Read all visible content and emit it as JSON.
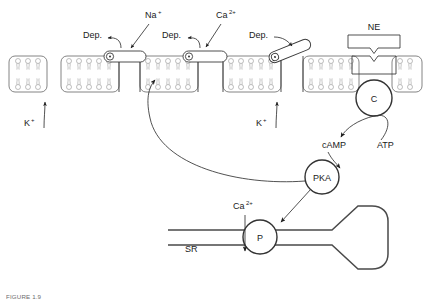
{
  "figure": {
    "caption_prefix": "FIGURE 1.9",
    "caption_text": "FIGURE 1.9"
  },
  "labels": {
    "na": "Na",
    "na_sup": "+",
    "ca": "Ca",
    "ca_sup": "2+",
    "k": "K",
    "k_sup": "+",
    "dep": "Dep.",
    "ne": "NE",
    "c": "C",
    "camp": "cAMP",
    "atp": "ATP",
    "pka": "PKA",
    "p": "P",
    "sr": "SR"
  },
  "ions": [
    {
      "name": "sodium",
      "text": "Na",
      "sup": "+",
      "x": 150,
      "y": 16
    },
    {
      "name": "calcium-extracellular",
      "text": "Ca",
      "sup": "2+",
      "x": 222,
      "y": 16
    },
    {
      "name": "potassium-left",
      "text": "K",
      "sup": "+",
      "x": 26,
      "y": 124
    },
    {
      "name": "potassium-right",
      "text": "K",
      "sup": "+",
      "x": 258,
      "y": 124
    },
    {
      "name": "calcium-sr",
      "text": "Ca",
      "sup": "2+",
      "x": 212,
      "y": 208
    }
  ],
  "depolarization_labels": [
    {
      "name": "dep-sodium-channel",
      "text": "Dep.",
      "x": 85,
      "y": 36
    },
    {
      "name": "dep-calcium-channel",
      "text": "Dep.",
      "x": 186,
      "y": 36
    },
    {
      "name": "dep-potassium-channel",
      "text": "Dep.",
      "x": 253,
      "y": 36
    }
  ],
  "nodes": [
    {
      "name": "adenylyl-cyclase-node",
      "text": "C",
      "cx": 374,
      "cy": 98,
      "r": 18
    },
    {
      "name": "pka-node",
      "text": "PKA",
      "cx": 322,
      "cy": 177,
      "r": 17
    },
    {
      "name": "phospholamban-node",
      "text": "P",
      "cx": 260,
      "cy": 237,
      "r": 17
    }
  ],
  "molecules": [
    {
      "name": "camp-label",
      "text": "cAMP",
      "x": 326,
      "y": 146
    },
    {
      "name": "atp-label",
      "text": "ATP",
      "x": 382,
      "y": 146
    },
    {
      "name": "norepinephrine-label",
      "text": "NE",
      "x": 374,
      "y": 27
    },
    {
      "name": "sarcoplasmic-reticulum-label",
      "text": "SR",
      "x": 190,
      "y": 250
    }
  ],
  "channels": [
    {
      "name": "sodium-channel-gate",
      "state": "closed",
      "ion": "Na+"
    },
    {
      "name": "calcium-channel-gate",
      "state": "closed",
      "ion": "Ca2+"
    },
    {
      "name": "potassium-channel-gate",
      "state": "open",
      "ion": "K+"
    }
  ],
  "colors": {
    "line": "#333333",
    "membrane_outline": "#666666",
    "lipid": "#8a8a8a",
    "caption": "#6d6d6d",
    "background": "#ffffff"
  }
}
